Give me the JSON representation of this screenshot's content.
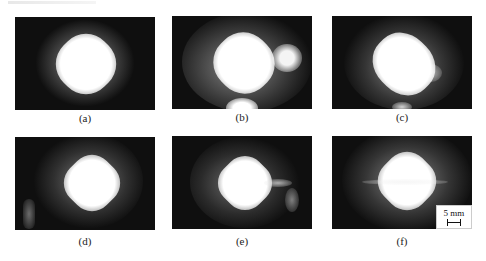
{
  "figure": {
    "panels": [
      {
        "id": "a",
        "label": "(a)"
      },
      {
        "id": "b",
        "label": "(b)"
      },
      {
        "id": "c",
        "label": "(c)"
      },
      {
        "id": "d",
        "label": "(d)"
      },
      {
        "id": "e",
        "label": "(e)"
      },
      {
        "id": "f",
        "label": "(f)"
      }
    ],
    "scale_bar": {
      "label": "5 mm"
    },
    "colors": {
      "background": "#0f0f0f",
      "glow": "#ffffff"
    }
  }
}
